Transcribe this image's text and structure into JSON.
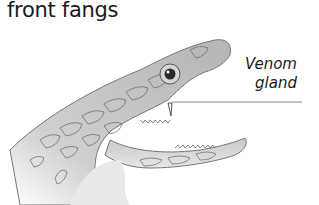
{
  "title": "front fangs",
  "labels": {
    "venom_gland_line1": "Venom",
    "venom_gland_line2": "gland"
  },
  "illustration": {
    "subject": "snake-head",
    "mouth": "open",
    "annotated_part": "venom-gland"
  },
  "colors": {
    "text": "#1a1a1a",
    "leader_line": "#888888",
    "scale_shade": "#bdbdbd",
    "scale_outline": "#6e6e6e"
  }
}
